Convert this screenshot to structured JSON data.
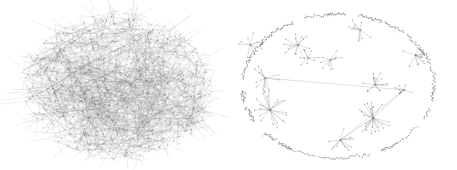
{
  "figure": {
    "width": 457,
    "height": 170,
    "background": "#ffffff",
    "panels": [
      {
        "id": "dense-network",
        "type": "network",
        "layout": "force-directed hairball",
        "center": [
          117,
          87
        ],
        "radius": [
          95,
          72
        ],
        "node_count": 900,
        "edge_count": 2600,
        "seed": 7,
        "edge_color": "#8a8a8a",
        "node_color": "#555555"
      },
      {
        "id": "clustered-network",
        "type": "network",
        "layout": "clustered star components on ellipse",
        "center": [
          108,
          86
        ],
        "radius": [
          96,
          72
        ],
        "ring_components": 22,
        "hubs": [
          {
            "x": 40,
            "y": 110,
            "spokes": 22,
            "r": 18
          },
          {
            "x": 143,
            "y": 118,
            "spokes": 24,
            "r": 16
          },
          {
            "x": 68,
            "y": 45,
            "spokes": 14,
            "r": 14
          },
          {
            "x": 145,
            "y": 85,
            "spokes": 14,
            "r": 12
          },
          {
            "x": 100,
            "y": 60,
            "spokes": 10,
            "r": 10
          },
          {
            "x": 185,
            "y": 55,
            "spokes": 12,
            "r": 12
          },
          {
            "x": 35,
            "y": 78,
            "spokes": 12,
            "r": 14
          },
          {
            "x": 78,
            "y": 58,
            "spokes": 8,
            "r": 10
          },
          {
            "x": 174,
            "y": 90,
            "spokes": 8,
            "r": 9
          },
          {
            "x": 20,
            "y": 45,
            "spokes": 10,
            "r": 12
          },
          {
            "x": 110,
            "y": 140,
            "spokes": 12,
            "r": 14
          },
          {
            "x": 130,
            "y": 30,
            "spokes": 10,
            "r": 12
          }
        ],
        "seed": 11,
        "edge_color": "#7a7a7a",
        "node_color": "#444444"
      }
    ]
  }
}
